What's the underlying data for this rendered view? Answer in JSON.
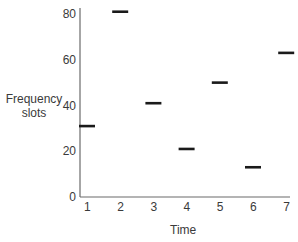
{
  "chart_data": {
    "type": "scatter",
    "marker": "horizontal-dash",
    "title": "",
    "xlabel": "Time",
    "ylabel": "Frequency slots",
    "x": [
      1,
      2,
      3,
      4,
      5,
      6,
      7
    ],
    "values": [
      31,
      81,
      41,
      21,
      50,
      13,
      63
    ],
    "x_ticks": [
      "1",
      "2",
      "3",
      "4",
      "5",
      "6",
      "7"
    ],
    "y_ticks": [
      "0",
      "20",
      "40",
      "60",
      "80"
    ],
    "ylim": [
      0,
      82
    ],
    "xlim": [
      1,
      7
    ],
    "grid": false,
    "legend": null,
    "colors": {
      "marker": "#1a1a1a",
      "axis": "#6b6b6b",
      "text": "#3a3a3a"
    }
  },
  "labels": {
    "ylabel_line1": "Frequency",
    "ylabel_line2": "slots",
    "xlabel": "Time"
  }
}
